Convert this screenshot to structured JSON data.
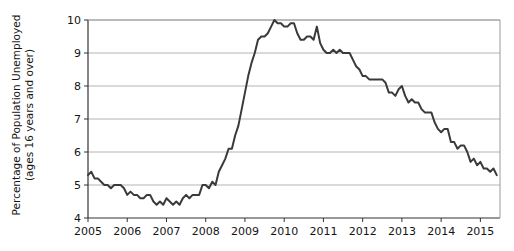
{
  "chart_data": {
    "type": "line",
    "title": "",
    "xlabel": "",
    "ylabel": "Percentage of Population Unemployed (ages 16 years and over)",
    "ylabel_line1": "Percentage of Population Unemployed",
    "ylabel_line2": "(ages 16 years and over)",
    "xlim": [
      2005.0,
      2015.5
    ],
    "ylim": [
      4,
      10
    ],
    "yticks": [
      4,
      5,
      6,
      7,
      8,
      9,
      10
    ],
    "ytick_labels": [
      "4",
      "5",
      "6",
      "7",
      "8",
      "9",
      "10"
    ],
    "xticks": [
      2005,
      2006,
      2007,
      2008,
      2009,
      2010,
      2011,
      2012,
      2013,
      2014,
      2015
    ],
    "xtick_labels": [
      "2005",
      "2006",
      "2007",
      "2008",
      "2009",
      "2010",
      "2011",
      "2012",
      "2013",
      "2014",
      "2015"
    ],
    "grid": true,
    "grid_axis": "y",
    "grid_color": "#b4b4b4",
    "legend": false,
    "line_color": "#3a3a3a",
    "line_width": 2.0,
    "series": [
      {
        "name": "Unemployment rate",
        "x": [
          2005.0,
          2005.083,
          2005.167,
          2005.25,
          2005.333,
          2005.417,
          2005.5,
          2005.583,
          2005.667,
          2005.75,
          2005.833,
          2005.917,
          2006.0,
          2006.083,
          2006.167,
          2006.25,
          2006.333,
          2006.417,
          2006.5,
          2006.583,
          2006.667,
          2006.75,
          2006.833,
          2006.917,
          2007.0,
          2007.083,
          2007.167,
          2007.25,
          2007.333,
          2007.417,
          2007.5,
          2007.583,
          2007.667,
          2007.75,
          2007.833,
          2007.917,
          2008.0,
          2008.083,
          2008.167,
          2008.25,
          2008.333,
          2008.417,
          2008.5,
          2008.583,
          2008.667,
          2008.75,
          2008.833,
          2008.917,
          2009.0,
          2009.083,
          2009.167,
          2009.25,
          2009.333,
          2009.417,
          2009.5,
          2009.583,
          2009.667,
          2009.75,
          2009.833,
          2009.917,
          2010.0,
          2010.083,
          2010.167,
          2010.25,
          2010.333,
          2010.417,
          2010.5,
          2010.583,
          2010.667,
          2010.75,
          2010.833,
          2010.917,
          2011.0,
          2011.083,
          2011.167,
          2011.25,
          2011.333,
          2011.417,
          2011.5,
          2011.583,
          2011.667,
          2011.75,
          2011.833,
          2011.917,
          2012.0,
          2012.083,
          2012.167,
          2012.25,
          2012.333,
          2012.417,
          2012.5,
          2012.583,
          2012.667,
          2012.75,
          2012.833,
          2012.917,
          2013.0,
          2013.083,
          2013.167,
          2013.25,
          2013.333,
          2013.417,
          2013.5,
          2013.583,
          2013.667,
          2013.75,
          2013.833,
          2013.917,
          2014.0,
          2014.083,
          2014.167,
          2014.25,
          2014.333,
          2014.417,
          2014.5,
          2014.583,
          2014.667,
          2014.75,
          2014.833,
          2014.917,
          2015.0,
          2015.083,
          2015.167,
          2015.25,
          2015.333,
          2015.417
        ],
        "values": [
          5.3,
          5.4,
          5.2,
          5.2,
          5.1,
          5.0,
          5.0,
          4.9,
          5.0,
          5.0,
          5.0,
          4.9,
          4.7,
          4.8,
          4.7,
          4.7,
          4.6,
          4.6,
          4.7,
          4.7,
          4.5,
          4.4,
          4.5,
          4.4,
          4.6,
          4.5,
          4.4,
          4.5,
          4.4,
          4.6,
          4.7,
          4.6,
          4.7,
          4.7,
          4.7,
          5.0,
          5.0,
          4.9,
          5.1,
          5.0,
          5.4,
          5.6,
          5.8,
          6.1,
          6.1,
          6.5,
          6.8,
          7.3,
          7.8,
          8.3,
          8.7,
          9.0,
          9.4,
          9.5,
          9.5,
          9.6,
          9.8,
          10.0,
          9.9,
          9.9,
          9.8,
          9.8,
          9.9,
          9.9,
          9.6,
          9.4,
          9.4,
          9.5,
          9.5,
          9.4,
          9.8,
          9.3,
          9.1,
          9.0,
          9.0,
          9.1,
          9.0,
          9.1,
          9.0,
          9.0,
          9.0,
          8.8,
          8.6,
          8.5,
          8.3,
          8.3,
          8.2,
          8.2,
          8.2,
          8.2,
          8.2,
          8.1,
          7.8,
          7.8,
          7.7,
          7.9,
          8.0,
          7.7,
          7.5,
          7.6,
          7.5,
          7.5,
          7.3,
          7.2,
          7.2,
          7.2,
          6.9,
          6.7,
          6.6,
          6.7,
          6.7,
          6.3,
          6.3,
          6.1,
          6.2,
          6.2,
          6.0,
          5.7,
          5.8,
          5.6,
          5.7,
          5.5,
          5.5,
          5.4,
          5.5,
          5.3
        ]
      }
    ]
  }
}
